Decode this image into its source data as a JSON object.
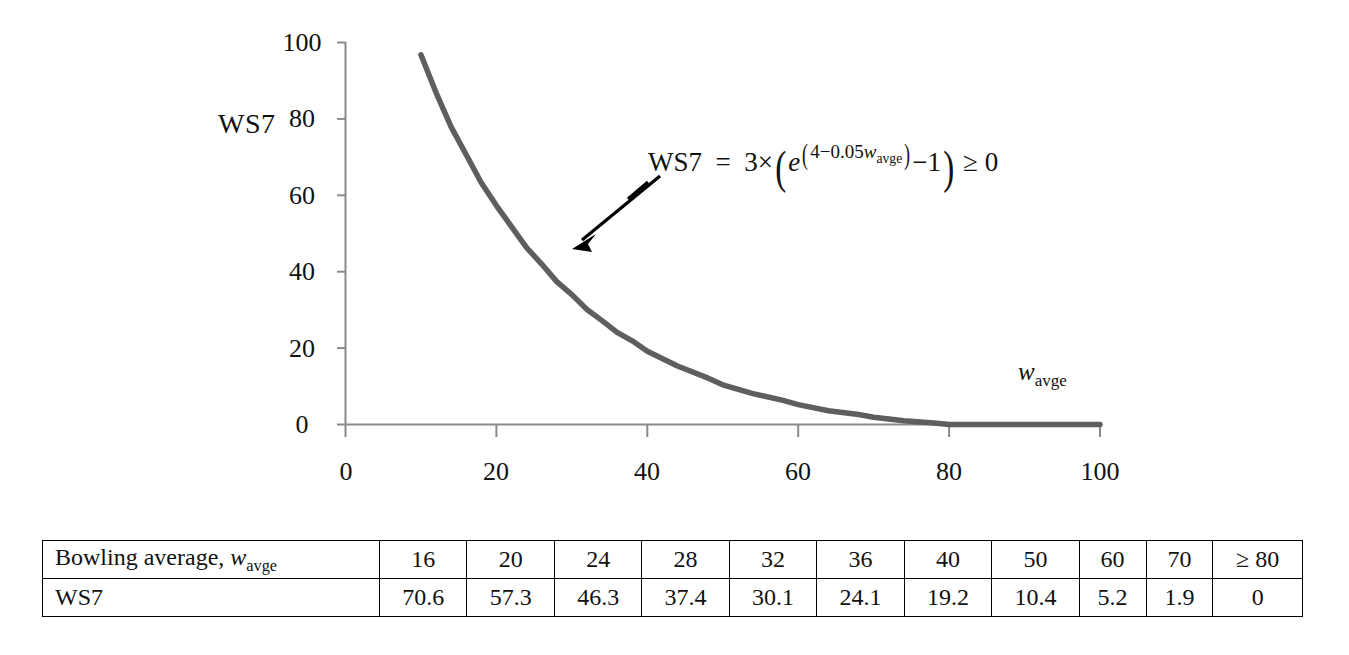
{
  "figure": {
    "y_axis_title": "WS7",
    "x_axis_title_base": "w",
    "x_axis_title_sub": "avge",
    "annotation": {
      "lhs": "WS7",
      "equals": "=",
      "coef": "3",
      "times": "×",
      "open_paren": "(",
      "e": "e",
      "exp_open": "(",
      "exp_body": "4−0.05",
      "exp_var": "w",
      "exp_var_sub": "avge",
      "exp_close": ")",
      "minus_one": "−1",
      "close_paren": ")",
      "ge_zero": "≥ 0",
      "full_text": "WS7 = 3 × (e^(4−0.05 w_avge) − 1) ≥ 0"
    },
    "arrow": {
      "name": "annotation-arrow",
      "tip_x": 572,
      "tip_y": 248,
      "tail_x": 660,
      "tail_y": 176
    },
    "curve_color": "#5e5e5e",
    "axis_color": "#808080"
  },
  "chart_data": {
    "type": "line",
    "title": "",
    "xlabel": "w_avge",
    "ylabel": "WS7",
    "xlim": [
      0,
      100
    ],
    "ylim": [
      0,
      100
    ],
    "xticks": [
      0,
      20,
      40,
      60,
      80,
      100
    ],
    "yticks": [
      0,
      20,
      40,
      60,
      80,
      100
    ],
    "xtick_labels": [
      "0",
      "20",
      "40",
      "60",
      "80",
      "100"
    ],
    "ytick_labels": [
      "0",
      "20",
      "40",
      "60",
      "80",
      "100"
    ],
    "grid": false,
    "legend": "none",
    "annotation": "WS7 = 3 × (e^(4−0.05 w_avge) − 1) ≥ 0",
    "equation": "WS7 = 3*(exp(4 - 0.05*w_avge) - 1), floored at 0",
    "series": [
      {
        "name": "WS7",
        "color": "#5e5e5e",
        "x": [
          10,
          12,
          14,
          16,
          18,
          20,
          22,
          24,
          26,
          28,
          30,
          32,
          34,
          36,
          38,
          40,
          44,
          48,
          50,
          54,
          58,
          60,
          64,
          68,
          70,
          74,
          78,
          80,
          85,
          90,
          95,
          100
        ],
        "y": [
          96.8,
          86.9,
          77.9,
          70.6,
          63.3,
          57.3,
          51.8,
          46.3,
          42.0,
          37.4,
          34.0,
          30.1,
          27.2,
          24.1,
          21.9,
          19.2,
          15.3,
          12.2,
          10.4,
          8.1,
          6.3,
          5.2,
          3.6,
          2.6,
          1.9,
          1.0,
          0.4,
          0.0,
          0.0,
          0.0,
          0.0,
          0.0
        ]
      }
    ],
    "table": {
      "row_headers": [
        "Bowling average, w_avge",
        "WS7"
      ],
      "columns": [
        "16",
        "20",
        "24",
        "28",
        "32",
        "36",
        "40",
        "50",
        "60",
        "70",
        "≥ 80"
      ],
      "values": [
        "70.6",
        "57.3",
        "46.3",
        "37.4",
        "30.1",
        "24.1",
        "19.2",
        "10.4",
        "5.2",
        "1.9",
        "0"
      ]
    }
  },
  "table": {
    "row1_label_base": "Bowling average, ",
    "row1_label_var": "w",
    "row1_label_sub": "avge",
    "row2_label": "WS7",
    "header_values": [
      "16",
      "20",
      "24",
      "28",
      "32",
      "36",
      "40",
      "50",
      "60",
      "70",
      "≥ 80"
    ],
    "ws7_values": [
      "70.6",
      "57.3",
      "46.3",
      "37.4",
      "30.1",
      "24.1",
      "19.2",
      "10.4",
      "5.2",
      "1.9",
      "0"
    ]
  }
}
